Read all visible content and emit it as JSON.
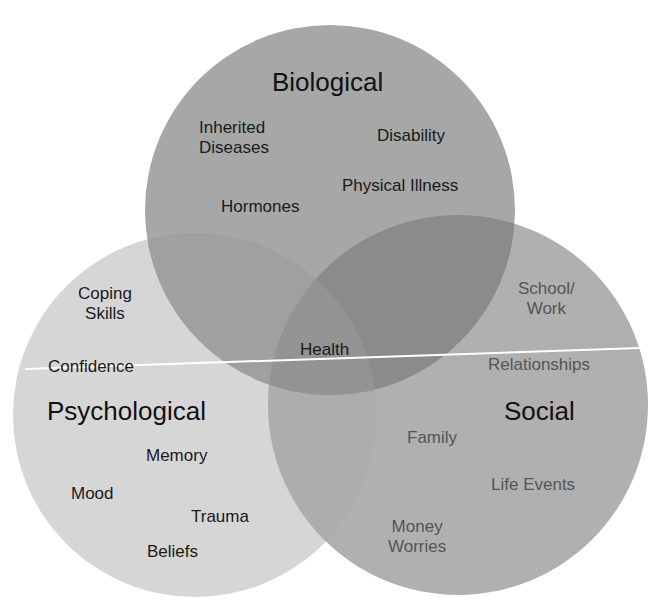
{
  "diagram": {
    "type": "venn",
    "colors": {
      "background": "#ffffff",
      "biological": "#a2a2a2",
      "psychological": "#d6d6d6",
      "social": "#a9a9a9",
      "bio_social_overlap": "#8b8b8b",
      "divider": "#ffffff"
    },
    "circles": {
      "biological": {
        "title": "Biological",
        "items": [
          "Inherited",
          "Diseases",
          "Disability",
          "Physical Illness",
          "Hormones"
        ]
      },
      "psychological": {
        "title": "Psychological",
        "items": [
          "Coping",
          "Skills",
          "Confidence",
          "Memory",
          "Mood",
          "Trauma",
          "Beliefs"
        ]
      },
      "social": {
        "title": "Social",
        "items": [
          "School/",
          "Work",
          "Relationships",
          "Family",
          "Life Events",
          "Money",
          "Worries"
        ]
      }
    },
    "center": {
      "label": "Health"
    }
  }
}
